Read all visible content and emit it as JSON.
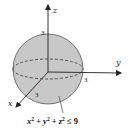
{
  "diagram": {
    "type": "3d-sphere-region",
    "inequality": {
      "lhs_terms": [
        "x",
        "y",
        "z"
      ],
      "exponent": "2",
      "operator": "≤",
      "rhs": "9"
    },
    "axes": {
      "x": {
        "label": "x",
        "tick": "3"
      },
      "y": {
        "label": "y",
        "tick": "3"
      },
      "z": {
        "label": "z",
        "tick": "3"
      }
    },
    "colors": {
      "sphere_fill": "#c8c8c8",
      "sphere_stroke": "#555555",
      "axis": "#222222",
      "background": "#ffffff"
    }
  }
}
